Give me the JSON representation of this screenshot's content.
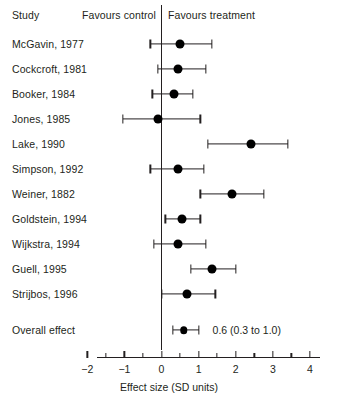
{
  "header": {
    "study_label": "Study",
    "favours_control": "Favours control",
    "favours_treatment": "Favours treatment"
  },
  "axis": {
    "title": "Effect size (SD units)",
    "ticks": [
      "−2",
      "−1",
      "0",
      "1",
      "2",
      "3",
      "4"
    ],
    "tick_values": [
      -2,
      -1,
      0,
      1,
      2,
      3,
      4
    ],
    "minor_step": 0.5,
    "range": [
      -2,
      4
    ],
    "null_value": 0
  },
  "overall": {
    "label": "Overall effect",
    "ci_text": "0.6 (0.3 to 1.0)"
  },
  "chart_data": {
    "type": "forest",
    "title": "",
    "xlabel": "Effect size (SD units)",
    "ylabel": "Study",
    "xlim": [
      -2,
      4
    ],
    "grid": false,
    "null_line": 0,
    "left_annotation": "Favours control",
    "right_annotation": "Favours treatment",
    "studies": [
      {
        "label": "McGavin, 1977",
        "effect": 0.5,
        "ci_low": -0.3,
        "ci_high": 1.35
      },
      {
        "label": "Cockcroft, 1981",
        "effect": 0.45,
        "ci_low": -0.1,
        "ci_high": 1.2
      },
      {
        "label": "Booker, 1984",
        "effect": 0.35,
        "ci_low": -0.25,
        "ci_high": 0.85
      },
      {
        "label": "Jones, 1985",
        "effect": -0.1,
        "ci_low": -1.05,
        "ci_high": 1.05
      },
      {
        "label": "Lake, 1990",
        "effect": 2.4,
        "ci_low": 1.25,
        "ci_high": 3.4
      },
      {
        "label": "Simpson, 1992",
        "effect": 0.45,
        "ci_low": -0.3,
        "ci_high": 1.15
      },
      {
        "label": "Weiner, 1882",
        "effect": 1.9,
        "ci_low": 1.05,
        "ci_high": 2.75
      },
      {
        "label": "Goldstein, 1994",
        "effect": 0.55,
        "ci_low": 0.1,
        "ci_high": 1.05
      },
      {
        "label": "Wijkstra, 1994",
        "effect": 0.45,
        "ci_low": -0.2,
        "ci_high": 1.2
      },
      {
        "label": "Guell, 1995",
        "effect": 1.35,
        "ci_low": 0.8,
        "ci_high": 2.0
      },
      {
        "label": "Strijbos, 1996",
        "effect": 0.7,
        "ci_low": 0.0,
        "ci_high": 1.45
      }
    ],
    "summary": {
      "label": "Overall effect",
      "effect": 0.6,
      "ci_low": 0.3,
      "ci_high": 1.0,
      "text": "0.6 (0.3 to 1.0)"
    }
  },
  "colors": {
    "ink": "#231f20",
    "marker": "#000000",
    "background": "#ffffff"
  }
}
